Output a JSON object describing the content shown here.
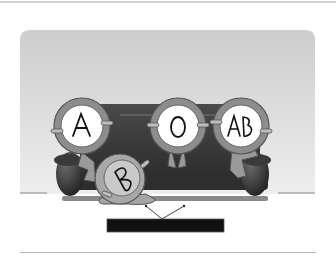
{
  "illustration": {
    "subject": "Blood type characters sitting on a sofa watching TV",
    "characters": [
      {
        "label": "A",
        "cx": 82,
        "cy": 126,
        "r": 28
      },
      {
        "label": "O",
        "cx": 178,
        "cy": 126,
        "r": 28
      },
      {
        "label": "AB",
        "cx": 241,
        "cy": 126,
        "r": 28
      },
      {
        "label": "B",
        "cx": 120,
        "cy": 179,
        "r": 25
      }
    ],
    "colors": {
      "panel_top": "#cfcfcf",
      "panel_bottom": "#ececec",
      "sofa": "#3a3a3a",
      "ring": "#8a8a8a",
      "face": "#ffffff",
      "tv": "#111111"
    }
  }
}
